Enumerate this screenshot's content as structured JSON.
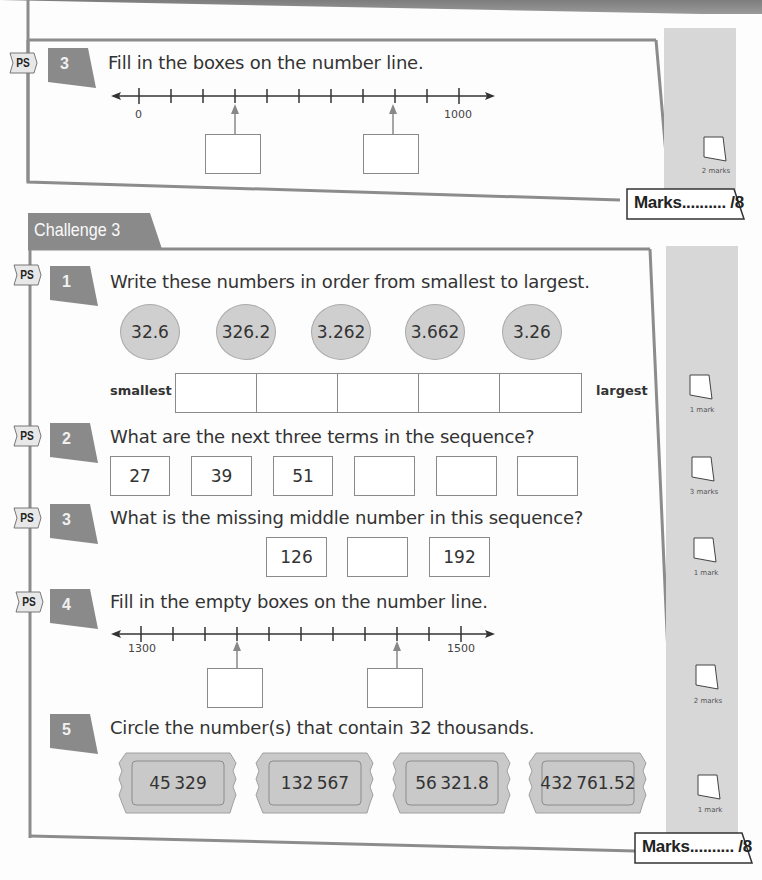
{
  "top_section": {
    "question": {
      "tag": "PS",
      "number": "3",
      "text": "Fill in the boxes on the number line.",
      "number_line": {
        "start_label": "0",
        "end_label": "1000",
        "ticks": 11,
        "arrow_tick_indices": [
          3,
          8
        ]
      },
      "marks_label": "2 marks"
    },
    "marks_total": "Marks.......... /8"
  },
  "challenge": {
    "title": "Challenge 3",
    "questions": [
      {
        "tag": "PS",
        "number": "1",
        "text": "Write these numbers in order from smallest to largest.",
        "bubbles": [
          "32.6",
          "326.2",
          "3.262",
          "3.662",
          "3.26"
        ],
        "left_label": "smallest",
        "right_label": "largest",
        "answer_boxes": 5,
        "marks_label": "1 mark"
      },
      {
        "tag": "PS",
        "number": "2",
        "text": "What are the next three terms in the sequence?",
        "terms": [
          "27",
          "39",
          "51",
          "",
          "",
          ""
        ],
        "marks_label": "3 marks"
      },
      {
        "tag": "PS",
        "number": "3",
        "text": "What is the missing middle number in this sequence?",
        "terms": [
          "126",
          "",
          "192"
        ],
        "marks_label": "1 mark"
      },
      {
        "tag": "PS",
        "number": "4",
        "text": "Fill in the empty boxes on the number line.",
        "number_line": {
          "start_label": "1300",
          "end_label": "1500",
          "ticks": 11,
          "arrow_tick_indices": [
            3,
            8
          ]
        },
        "marks_label": "2 marks"
      },
      {
        "tag": "",
        "number": "5",
        "text": "Circle the number(s) that contain 32 thousands.",
        "tickets": [
          "45 329",
          "132 567",
          "56 321.8",
          "432 761.52"
        ],
        "marks_label": "1 mark"
      }
    ],
    "marks_total": "Marks.......... /8"
  },
  "colors": {
    "badge": "#8a8a8a",
    "frame": "#8c8c8c",
    "margin_strip": "#d7d7d7",
    "bubble_fill": "#cfcfcf",
    "ticket_fill": "#c9c9c9"
  }
}
